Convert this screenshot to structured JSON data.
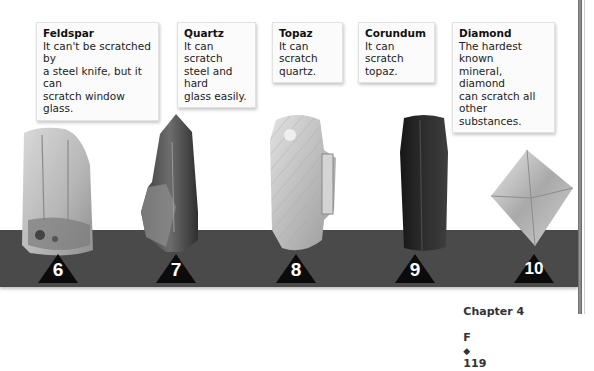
{
  "minerals": [
    {
      "name": "Feldspar",
      "hardness": "6",
      "description_lines": [
        "It can't be scratched by",
        "a steel knife, but it can",
        "scratch window glass."
      ]
    },
    {
      "name": "Quartz",
      "hardness": "7",
      "description_lines": [
        "It can scratch",
        "steel and hard",
        "glass easily."
      ]
    },
    {
      "name": "Topaz",
      "hardness": "8",
      "description_lines": [
        "It can scratch",
        "quartz."
      ]
    },
    {
      "name": "Corundum",
      "hardness": "9",
      "description_lines": [
        "It can scratch",
        "topaz."
      ]
    },
    {
      "name": "Diamond",
      "hardness": "10",
      "description_lines": [
        "The hardest known",
        "mineral, diamond",
        "can scratch all",
        "other substances."
      ]
    }
  ],
  "footer": {
    "chapter": "Chapter 4",
    "section": "F",
    "separator": "◆",
    "page_number": "119"
  },
  "colors": {
    "band": "#4a4a4a",
    "triangle": "#0b0b0b",
    "callout_bg": "#fbfbfb"
  }
}
